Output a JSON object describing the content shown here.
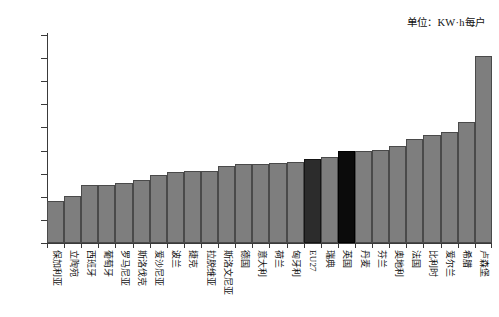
{
  "unit_note": "单位：KW·h每户",
  "chart_data": {
    "type": "bar",
    "title": "",
    "subtitle": "",
    "xlabel": "",
    "ylabel": "",
    "unit_annotation": "单位：KW·h每户",
    "ylim": [
      0,
      45000
    ],
    "ytick_labels": [
      "45 000",
      "40 000",
      "35 000",
      "30 000",
      "25 000",
      "20 000",
      "15 000",
      "10 000",
      "5 000",
      "0"
    ],
    "ytick_values": [
      45000,
      40000,
      35000,
      30000,
      25000,
      20000,
      15000,
      10000,
      5000,
      0
    ],
    "grid": false,
    "legend": false,
    "bar_color": "#7e7e7e",
    "highlight_colors": {
      "eu27": "#2c2c2c",
      "uk": "#0b0b0b"
    },
    "categories": [
      "保加利亚",
      "立陶宛",
      "西班牙",
      "葡萄牙",
      "罗马尼亚",
      "斯洛伐克",
      "爱沙尼亚",
      "波兰",
      "捷克",
      "拉脱维亚",
      "斯洛文尼亚",
      "德国",
      "意大利",
      "荷兰",
      "匈牙利",
      "EU27",
      "瑞典",
      "英国",
      "丹麦",
      "芬兰",
      "奥地利",
      "法国",
      "比利时",
      "爱尔兰",
      "希腊",
      "卢森堡"
    ],
    "values": [
      9000,
      10200,
      12500,
      12600,
      12900,
      13700,
      14800,
      15300,
      15500,
      15600,
      16600,
      17000,
      17200,
      17300,
      17500,
      18200,
      18600,
      19800,
      20000,
      20100,
      21000,
      22500,
      23300,
      24000,
      26200,
      40500
    ],
    "highlighted": [
      "EU27",
      "英国"
    ]
  }
}
